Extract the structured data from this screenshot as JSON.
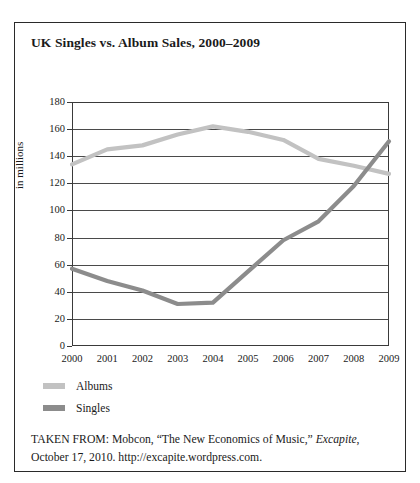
{
  "figure": {
    "title": "UK Singles vs. Album Sales, 2000–2009",
    "caption_line1_pre": "TAKEN FROM: Mobcon, “The New Economics of Music,” ",
    "caption_source_italic": "Excapite",
    "caption_line1_post": ",",
    "caption_line2": "October 17, 2010. http://excapite.wordpress.com."
  },
  "colors": {
    "albums": "#c2c2c2",
    "singles": "#8c8c8c",
    "axis": "#3a3a3a",
    "grid": "#4a4a4a",
    "border": "#2a2a2a",
    "text": "#1a1a1a",
    "background": "#ffffff"
  },
  "chart_data": {
    "type": "line",
    "title": "UK Singles vs. Album Sales, 2000–2009",
    "xlabel": "",
    "ylabel": "in millions",
    "categories": [
      "2000",
      "2001",
      "2002",
      "2003",
      "2004",
      "2005",
      "2006",
      "2007",
      "2008",
      "2009"
    ],
    "x": [
      2000,
      2001,
      2002,
      2003,
      2004,
      2005,
      2006,
      2007,
      2008,
      2009
    ],
    "ylim": [
      0,
      180
    ],
    "xlim": [
      2000,
      2009
    ],
    "yticks": [
      0,
      20,
      40,
      60,
      80,
      100,
      120,
      140,
      160,
      180
    ],
    "ytick_labels": [
      "0",
      "20",
      "40",
      "60",
      "80",
      "100",
      "120",
      "140",
      "160",
      "180"
    ],
    "grid": "horizontal",
    "legend_position": "below-left",
    "series": [
      {
        "name": "Albums",
        "color": "#c2c2c2",
        "values": [
          134,
          145,
          148,
          156,
          162,
          158,
          152,
          138,
          133,
          127
        ]
      },
      {
        "name": "Singles",
        "color": "#8c8c8c",
        "values": [
          57,
          48,
          41,
          31,
          32,
          55,
          78,
          92,
          118,
          151
        ]
      }
    ]
  },
  "legend": {
    "items": [
      {
        "label": "Albums",
        "color": "#c2c2c2"
      },
      {
        "label": "Singles",
        "color": "#8c8c8c"
      }
    ]
  }
}
